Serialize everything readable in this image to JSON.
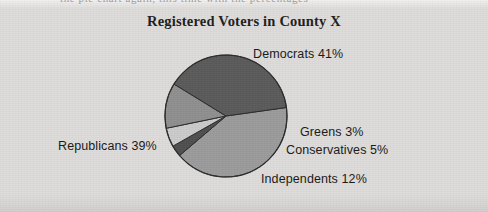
{
  "document": {
    "top_cut_text": "the pie chart again, this time with the percentages",
    "background_color": "#dddcda"
  },
  "chart_data": {
    "type": "pie",
    "title": "Registered Voters in County X",
    "xlabel": "",
    "ylabel": "",
    "legend_position": "labels-around-pie",
    "grid": false,
    "categories": [
      "Democrats",
      "Greens",
      "Conservatives",
      "Independents",
      "Republicans"
    ],
    "values": [
      41,
      3,
      5,
      12,
      39
    ],
    "unit": "%",
    "slices": [
      {
        "label": "Democrats",
        "value": 41,
        "label_text": "Democrats 41%",
        "color": "#9b9b9b"
      },
      {
        "label": "Greens",
        "value": 3,
        "label_text": "Greens 3%",
        "color": "#4f4f4f"
      },
      {
        "label": "Conservatives",
        "value": 5,
        "label_text": "Conservatives 5%",
        "color": "#cbcbcb"
      },
      {
        "label": "Independents",
        "value": 12,
        "label_text": "Independents 12%",
        "color": "#8f8f8f"
      },
      {
        "label": "Republicans",
        "value": 39,
        "label_text": "Republicans 39%",
        "color": "#5a5a5a"
      }
    ],
    "stroke_color": "#2b2b2b",
    "total": 100
  }
}
